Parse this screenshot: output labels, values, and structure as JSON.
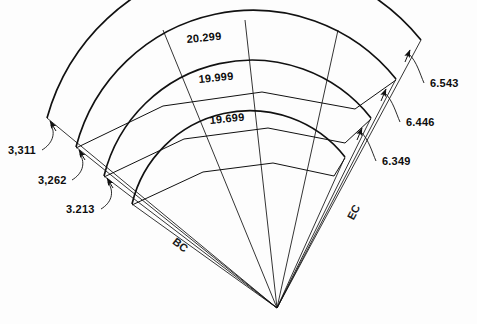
{
  "figure": {
    "background_color": "#fdfdfd",
    "line_color": "#111111"
  },
  "chord_labels": [
    {
      "name": "outer-chord-length",
      "value": "20.299"
    },
    {
      "name": "middle-chord-length",
      "value": "19.999"
    },
    {
      "name": "inner-chord-length",
      "value": "19.699"
    }
  ],
  "left_offsets": [
    {
      "name": "outer-left-offset",
      "value": "3,311"
    },
    {
      "name": "middle-left-offset",
      "value": "3,262"
    },
    {
      "name": "inner-left-offset",
      "value": "3.213"
    }
  ],
  "right_offsets": [
    {
      "name": "outer-right-offset",
      "value": "6.543"
    },
    {
      "name": "middle-right-offset",
      "value": "6.446"
    },
    {
      "name": "inner-right-offset",
      "value": "6.349"
    }
  ],
  "station_markers": [
    {
      "name": "begin-curve",
      "value": "BC"
    },
    {
      "name": "end-curve",
      "value": "EC"
    }
  ]
}
